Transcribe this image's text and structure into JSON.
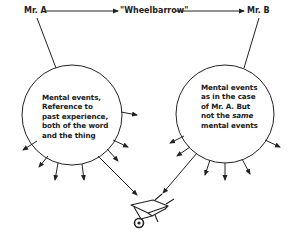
{
  "diagram": {
    "speaker": "Mr. A",
    "word": "\"Wheelbarrow\"",
    "listener": "Mr. B",
    "left_circle": {
      "lines": [
        "Mental events,",
        "Reference to",
        "past experience,",
        "both of the word",
        "and the thing"
      ]
    },
    "right_circle": {
      "lines": [
        "Mental events",
        "as in the case",
        "of Mr. A. But"
      ],
      "line4_prefix": "not the ",
      "line4_emphasis": "same",
      "line5": "mental events"
    },
    "object_icon": "wheelbarrow-icon",
    "colors": {
      "ink": "#222222",
      "background": "#ffffff"
    }
  }
}
